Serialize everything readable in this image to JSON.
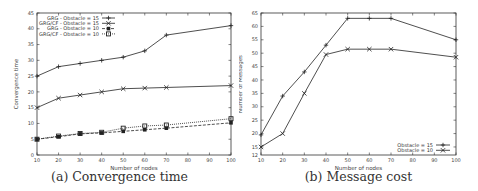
{
  "chart_data": [
    {
      "type": "line",
      "caption": "(a) Convergence time",
      "title": "",
      "xlabel": "Number of nodes",
      "ylabel": "Convergence time",
      "x": [
        10,
        20,
        30,
        40,
        50,
        60,
        70,
        100
      ],
      "xticks": [
        10,
        20,
        30,
        40,
        50,
        60,
        70,
        80,
        90,
        100
      ],
      "yticks": [
        0,
        5,
        10,
        15,
        20,
        25,
        30,
        35,
        40,
        45
      ],
      "xlim": [
        10,
        100
      ],
      "ylim": [
        0,
        45
      ],
      "grid": false,
      "legend_position": "upper left",
      "series": [
        {
          "name": "GRG - Obstacle = 15",
          "values": [
            25,
            28,
            29,
            30,
            31,
            33,
            38,
            41
          ],
          "marker": "plus",
          "dash": "solid"
        },
        {
          "name": "GRG/CF - Obstacle = 15",
          "values": [
            15,
            18,
            19,
            20,
            21,
            21.2,
            21.4,
            22
          ],
          "marker": "cross",
          "dash": "solid"
        },
        {
          "name": "GRG - Obstacle = 10",
          "values": [
            5,
            5.8,
            6.7,
            7,
            7.5,
            8,
            8.5,
            10.2
          ],
          "marker": "filled-square",
          "dash": "dashed"
        },
        {
          "name": "GRG/CF - Obstacle = 10",
          "values": [
            5,
            6,
            6.8,
            7.2,
            8.5,
            9.2,
            9.5,
            11.5
          ],
          "marker": "open-square",
          "dash": "dotted"
        }
      ]
    },
    {
      "type": "line",
      "caption": "(b) Message cost",
      "title": "",
      "xlabel": "Number of nodes",
      "ylabel": "Number of Messages",
      "x": [
        10,
        20,
        30,
        40,
        50,
        60,
        70,
        100
      ],
      "xticks": [
        10,
        20,
        30,
        40,
        50,
        60,
        70,
        80,
        90,
        100
      ],
      "yticks": [
        15,
        20,
        25,
        30,
        35,
        40,
        45,
        50,
        55,
        60,
        65
      ],
      "xlim": [
        10,
        100
      ],
      "ylim": [
        12,
        65
      ],
      "grid": false,
      "legend_position": "lower right",
      "series": [
        {
          "name": "Obstacle = 15",
          "values": [
            19.5,
            34,
            43,
            53,
            63,
            63,
            63,
            55
          ],
          "marker": "plus",
          "dash": "solid"
        },
        {
          "name": "Obstacle = 10",
          "values": [
            15,
            20,
            35,
            49.5,
            51.5,
            51.5,
            51.5,
            48.5
          ],
          "marker": "cross",
          "dash": "solid"
        }
      ]
    }
  ]
}
